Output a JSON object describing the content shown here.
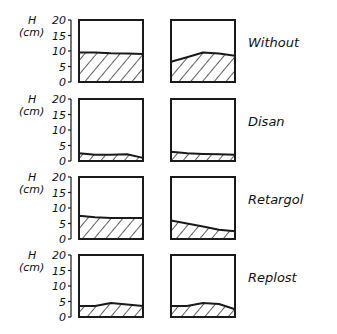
{
  "figure": {
    "y_axis": {
      "symbol": "H",
      "unit": "(cm)",
      "ticks": [
        "20",
        "15",
        "10",
        "5",
        "0"
      ]
    },
    "rows": [
      {
        "label": "Without",
        "left_profile": [
          9.5,
          9.5,
          9.3,
          9.2,
          9.0
        ],
        "right_profile": [
          6.5,
          8.0,
          9.5,
          9.2,
          8.5
        ]
      },
      {
        "label": "Disan",
        "left_profile": [
          2.5,
          2.0,
          2.0,
          2.2,
          1.0
        ],
        "right_profile": [
          3.0,
          2.5,
          2.3,
          2.2,
          2.0
        ]
      },
      {
        "label": "Retargol",
        "left_profile": [
          7.5,
          7.0,
          6.8,
          6.8,
          6.8
        ],
        "right_profile": [
          6.0,
          5.0,
          4.0,
          3.0,
          2.5
        ]
      },
      {
        "label": "Replost",
        "left_profile": [
          3.5,
          3.5,
          4.5,
          4.0,
          3.5
        ],
        "right_profile": [
          3.5,
          3.5,
          4.5,
          4.2,
          2.5
        ]
      }
    ]
  }
}
